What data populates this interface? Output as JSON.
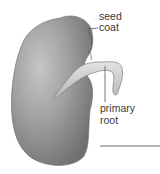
{
  "diagram": {
    "labels": {
      "seed_coat": [
        "seed",
        "coat"
      ],
      "primary_root": [
        "primary",
        "root"
      ]
    },
    "colors": {
      "seed_dark": "#7a7a7a",
      "seed_mid": "#9a9a9a",
      "seed_light": "#c4c4c4",
      "root_fill": "#d0d0d0",
      "line": "#555555",
      "text": "#3a3a3a"
    }
  }
}
